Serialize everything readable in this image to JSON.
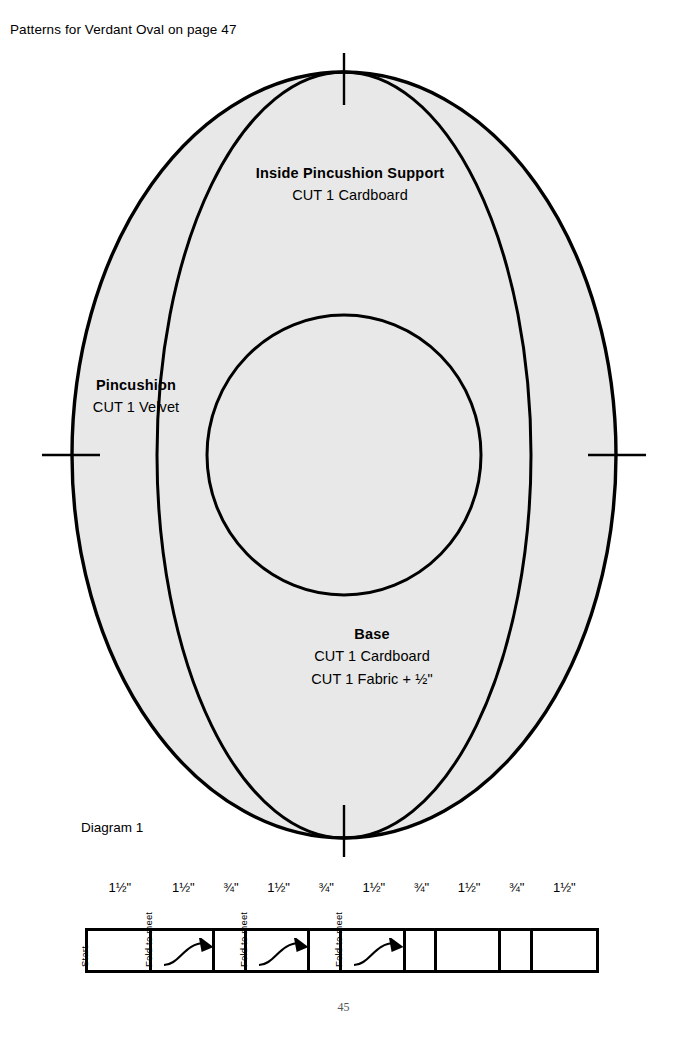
{
  "header": {
    "caption": "Patterns for Verdant Oval on page 47"
  },
  "pattern": {
    "fill_color": "#e8e8e8",
    "stroke_color": "#000000",
    "pieces": [
      {
        "id": "inside-pincushion-support",
        "title": "Inside Pincushion Support",
        "lines": [
          "CUT 1 Cardboard"
        ]
      },
      {
        "id": "pincushion",
        "title": "Pincushion",
        "lines": [
          "CUT 1 Velvet"
        ]
      },
      {
        "id": "base",
        "title": "Base",
        "lines": [
          "CUT 1 Cardboard",
          "CUT 1 Fabric + ½\""
        ]
      }
    ]
  },
  "diagram": {
    "caption": "Diagram 1",
    "measurements": [
      "1½\"",
      "1½\"",
      "¾\"",
      "1½\"",
      "¾\"",
      "1½\"",
      "¾\"",
      "1½\"",
      "¾\"",
      "1½\""
    ],
    "cells": [
      {
        "label": "Start",
        "width_in": "1½\"",
        "has_arrow": false
      },
      {
        "label": "Fold to meet",
        "width_in": "1½\"",
        "has_arrow": true
      },
      {
        "label": "",
        "width_in": "¾\"",
        "has_arrow": false
      },
      {
        "label": "Fold to meet",
        "width_in": "1½\"",
        "has_arrow": true
      },
      {
        "label": "",
        "width_in": "¾\"",
        "has_arrow": false
      },
      {
        "label": "Fold to meet",
        "width_in": "1½\"",
        "has_arrow": true
      },
      {
        "label": "",
        "width_in": "¾\"",
        "has_arrow": false
      },
      {
        "label": "",
        "width_in": "1½\"",
        "has_arrow": false
      },
      {
        "label": "",
        "width_in": "¾\"",
        "has_arrow": false
      },
      {
        "label": "",
        "width_in": "1½\"",
        "has_arrow": false
      }
    ]
  },
  "footer": {
    "page_number": "45"
  }
}
